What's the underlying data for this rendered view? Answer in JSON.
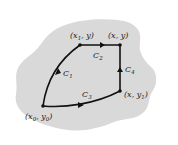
{
  "diagram": {
    "region_color": "#d9d9d9",
    "curve_color": "#111111",
    "points": [
      {
        "id": "p0",
        "label": "(x0, y0)",
        "base": "(x",
        "sub1": "0",
        "mid": ", y",
        "sub2": "0",
        "end": ")"
      },
      {
        "id": "p1",
        "label": "(x1, y)",
        "base": "(x",
        "sub1": "1",
        "mid": ", y)"
      },
      {
        "id": "p2",
        "label": "(x, y)",
        "text": "(x, y)"
      },
      {
        "id": "p3",
        "label": "(x, y1)",
        "base": "(x, y",
        "sub1": "1",
        "end": ")"
      }
    ],
    "curves": [
      {
        "id": "C1",
        "base": "C",
        "sub": "1"
      },
      {
        "id": "C2",
        "base": "C",
        "sub": "2"
      },
      {
        "id": "C3",
        "base": "C",
        "sub": "3"
      },
      {
        "id": "C4",
        "base": "C",
        "sub": "4"
      }
    ]
  }
}
